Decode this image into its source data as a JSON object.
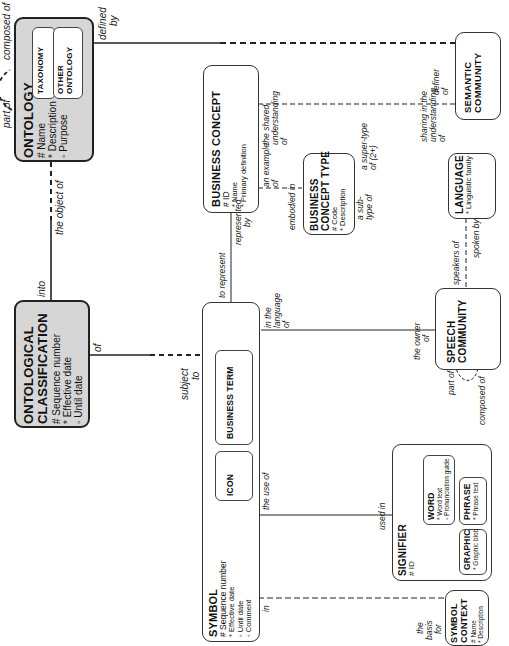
{
  "diagram": {
    "orientation": "rotated-90-ccw",
    "entities": {
      "ontology": {
        "title": "ONTOLOGY",
        "attributes": [
          "# Name",
          "* Description",
          "◦ Purpose"
        ],
        "subtypes": [
          "TAXONOMY",
          "OTHER ONTOLOGY"
        ]
      },
      "ontological_classification": {
        "title_line1": "ONTOLOGICAL",
        "title_line2": "CLASSIFICATION",
        "attributes": [
          "# Sequence number",
          "* Effective date",
          "◦ Until date"
        ]
      },
      "semantic_community": {
        "title_line1": "SEMANTIC",
        "title_line2": "COMMUNITY"
      },
      "business_concept": {
        "title": "BUSINESS CONCEPT",
        "attributes": [
          "# ID",
          "* Name",
          "* Primary definition"
        ]
      },
      "business_concept_type": {
        "title_line1": "BUSINESS",
        "title_line2": "CONCEPT TYPE",
        "attributes": [
          "# Code",
          "* Description"
        ]
      },
      "language": {
        "title": "LANGUAGE",
        "attributes": [
          "* Linguistic family"
        ]
      },
      "speech_community": {
        "title_line1": "SPEECH",
        "title_line2": "COMMUNITY"
      },
      "symbol": {
        "title": "SYMBOL",
        "attributes": [
          "# Sequence number",
          "* Effective date",
          "◦ Until date",
          "◦ Comment"
        ],
        "subtypes": [
          "BUSINESS TERM",
          "ICON"
        ]
      },
      "signifier": {
        "title": "SIGNIFIER",
        "attributes": [
          "# ID"
        ],
        "subtypes": {
          "word": {
            "title": "WORD",
            "attributes": [
              "* Word text",
              "◦ Pronunciation guide"
            ]
          },
          "phrase": {
            "title": "PHRASE",
            "attributes": [
              "* Phrase text"
            ]
          },
          "graphic": {
            "title": "GRAPHIC",
            "attributes": [
              "* Graphic blob"
            ]
          }
        }
      },
      "symbol_context": {
        "title_line1": "SYMBOL",
        "title_line2": "CONTEXT",
        "attributes": [
          "# Name",
          "* Description"
        ]
      }
    },
    "relationship_labels": {
      "ontology_part_of": "part of",
      "ontology_composed_of": "composed of",
      "ontology_defined_by_1": "defined",
      "ontology_defined_by_2": "by",
      "ontology_object_of": "the object of",
      "classification_into": "into",
      "classification_of": "of",
      "symbol_subject_to_1": "subject",
      "symbol_subject_to_2": "to",
      "semcom_definer_1": "definer",
      "semcom_definer_2": "of",
      "bc_shared_1": "the shared",
      "bc_shared_2": "understanding",
      "bc_shared_3": "of",
      "semcom_sharing_1": "sharing in the",
      "semcom_sharing_2": "understanding",
      "semcom_sharing_3": "of",
      "bc_example_1": "an example",
      "bc_example_2": "of",
      "bct_embodied_in": "embodied in",
      "bc_represented_1": "represented",
      "bc_represented_2": "by",
      "symbol_to_represent": "to represent",
      "bct_supertype_1": "a super-type",
      "bct_supertype_2": "of (2+)",
      "bct_subtype_1": "a sub-",
      "bct_subtype_2": "type of",
      "symbol_language_1": "in the",
      "symbol_language_2": "language",
      "symbol_language_3": "of",
      "language_speakers_of": "speakers of",
      "language_spoken_by": "spoken by",
      "speech_owner_1": "the owner",
      "speech_owner_2": "of",
      "speech_part_of": "part of",
      "speech_composed_of": "composed of",
      "symbol_use_of": "the use of",
      "signifier_used_in": "used in",
      "symbol_in": "in",
      "context_basis_1": "the",
      "context_basis_2": "basis",
      "context_basis_3": "for"
    }
  }
}
